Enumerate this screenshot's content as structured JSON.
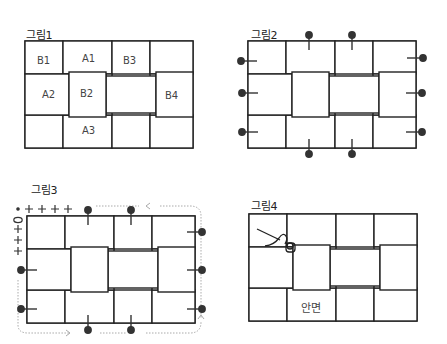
{
  "figures": [
    {
      "id": "fig1",
      "title": "그림1",
      "labels": {
        "B1": "B1",
        "A1": "A1",
        "B3": "B3",
        "A2": "A2",
        "B2": "B2",
        "B4": "B4",
        "A3": "A3"
      }
    },
    {
      "id": "fig2",
      "title": "그림2",
      "pins": "12 pins around the perimeter (2 top, 2 bottom, 3 left, 3 right)"
    },
    {
      "id": "fig3",
      "title": "그림3",
      "stitch_marks": {
        "top_row": "• + + + +",
        "left_column": "0 + + +"
      },
      "arrows": "dotted arrow path around the perimeter"
    },
    {
      "id": "fig4",
      "title": "그림4",
      "center_label": "안면",
      "needle": "needle and thread at top-left junction"
    }
  ],
  "colors": {
    "line": "#222222",
    "pin": "#333333",
    "dotted": "#aaaaaa",
    "text": "#333333"
  }
}
